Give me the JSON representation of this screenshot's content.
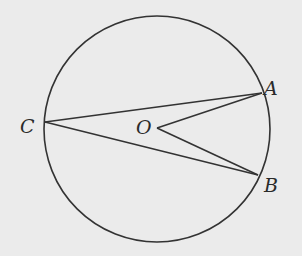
{
  "diagram": {
    "type": "circle-geometry",
    "background": "#ebebeb",
    "stroke_color": "#333333",
    "circle": {
      "cx": 157,
      "cy": 129,
      "r": 113
    },
    "points": {
      "A": {
        "x": 262,
        "y": 93
      },
      "B": {
        "x": 258,
        "y": 175
      },
      "C": {
        "x": 45,
        "y": 122
      },
      "O": {
        "x": 157,
        "y": 128
      }
    },
    "segments": [
      {
        "from": "C",
        "to": "A"
      },
      {
        "from": "C",
        "to": "B"
      },
      {
        "from": "O",
        "to": "A"
      },
      {
        "from": "O",
        "to": "B"
      }
    ],
    "labels": {
      "A": "A",
      "B": "B",
      "C": "C",
      "O": "O"
    }
  }
}
